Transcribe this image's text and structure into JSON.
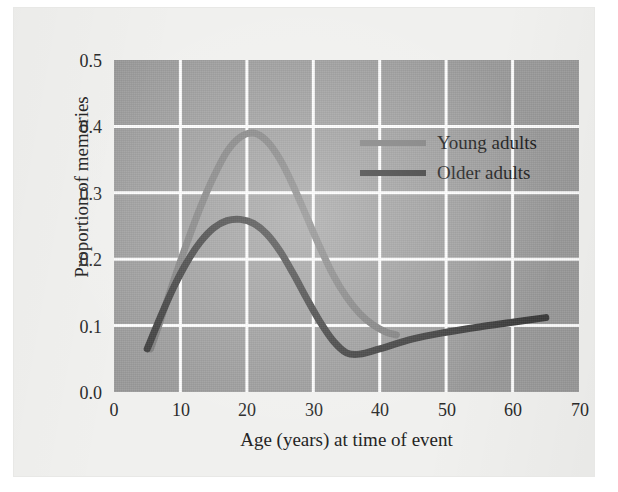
{
  "chart_data": {
    "type": "line",
    "title": "",
    "xlabel": "Age (years) at time of event",
    "ylabel": "Proportion of memories",
    "xlim": [
      0,
      70
    ],
    "ylim": [
      0.0,
      0.5
    ],
    "xticks": [
      "0",
      "10",
      "20",
      "30",
      "40",
      "50",
      "60",
      "70"
    ],
    "xtick_values": [
      0,
      10,
      20,
      30,
      40,
      50,
      60,
      70
    ],
    "yticks": [
      "0.0",
      "0.1",
      "0.2",
      "0.3",
      "0.4",
      "0.5"
    ],
    "ytick_values": [
      0.0,
      0.1,
      0.2,
      0.3,
      0.4,
      0.5
    ],
    "grid": true,
    "legend_position": "upper right inside plot",
    "plot_background_color": "#9b9b9b",
    "grid_color": "#ffffff",
    "series": [
      {
        "name": "Young adults",
        "color": "#7d7d7d",
        "x": [
          5.5,
          7,
          9,
          11,
          13,
          15,
          17,
          19,
          21,
          23,
          25,
          27,
          29,
          31,
          33,
          35,
          37,
          39,
          41,
          42.5
        ],
        "y": [
          0.065,
          0.108,
          0.168,
          0.225,
          0.278,
          0.324,
          0.362,
          0.384,
          0.39,
          0.378,
          0.35,
          0.31,
          0.264,
          0.218,
          0.176,
          0.143,
          0.118,
          0.101,
          0.09,
          0.086
        ]
      },
      {
        "name": "Older adults",
        "color": "#3a3a3a",
        "x": [
          5,
          7,
          9,
          11,
          13,
          15,
          17,
          19,
          21,
          23,
          25,
          27,
          29,
          31,
          33,
          35,
          37,
          40,
          45,
          50,
          55,
          60,
          65
        ],
        "y": [
          0.065,
          0.113,
          0.158,
          0.196,
          0.226,
          0.247,
          0.258,
          0.26,
          0.254,
          0.238,
          0.212,
          0.178,
          0.141,
          0.106,
          0.077,
          0.059,
          0.057,
          0.065,
          0.08,
          0.09,
          0.098,
          0.105,
          0.112
        ]
      }
    ],
    "annotations": {
      "young_peak": {
        "x": 21,
        "y": 0.39
      },
      "older_peak": {
        "x": 19,
        "y": 0.26
      },
      "older_trough": {
        "x": 35.5,
        "y": 0.057
      }
    }
  },
  "legend": {
    "items": [
      {
        "label": "Young adults",
        "color": "#7d7d7d"
      },
      {
        "label": "Older adults",
        "color": "#3a3a3a"
      }
    ]
  }
}
